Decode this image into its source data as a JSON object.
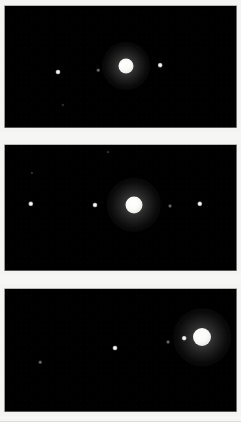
{
  "figure": {
    "background_color": "#f4f4f2",
    "plate_color": "#000000",
    "gap_color": "#f6f6f4",
    "object_color": "#ffffff"
  },
  "panels": [
    {
      "id": "panel-1",
      "label": "Exposure 1",
      "frame": {
        "x": 4,
        "y": 5,
        "width": 233,
        "height": 123
      },
      "planet": {
        "name": "jupiter-disc",
        "cx": 126,
        "cy": 66,
        "radius": 7.5,
        "brightness": "saturated"
      },
      "moons": [
        {
          "name": "moon-point",
          "cx": 58,
          "cy": 72,
          "radius": 1.4,
          "brightness": "bright"
        },
        {
          "name": "moon-point",
          "cx": 98,
          "cy": 70,
          "radius": 1.0,
          "brightness": "faint"
        },
        {
          "name": "moon-point",
          "cx": 160,
          "cy": 65,
          "radius": 1.3,
          "brightness": "bright"
        },
        {
          "name": "moon-point",
          "cx": 63,
          "cy": 105,
          "radius": 0.9,
          "brightness": "veryfaint"
        }
      ]
    },
    {
      "id": "panel-2",
      "label": "Exposure 2",
      "frame": {
        "x": 4,
        "y": 144,
        "width": 233,
        "height": 127
      },
      "planet": {
        "name": "jupiter-disc",
        "cx": 134,
        "cy": 205,
        "radius": 8.5,
        "brightness": "saturated"
      },
      "moons": [
        {
          "name": "moon-point",
          "cx": 31,
          "cy": 204,
          "radius": 1.5,
          "brightness": "bright"
        },
        {
          "name": "moon-point",
          "cx": 95,
          "cy": 205,
          "radius": 1.4,
          "brightness": "bright"
        },
        {
          "name": "moon-point",
          "cx": 170,
          "cy": 206,
          "radius": 1.1,
          "brightness": "faint"
        },
        {
          "name": "moon-point",
          "cx": 200,
          "cy": 204,
          "radius": 1.5,
          "brightness": "bright"
        },
        {
          "name": "moon-point",
          "cx": 32,
          "cy": 173,
          "radius": 0.9,
          "brightness": "veryfaint"
        },
        {
          "name": "moon-point",
          "cx": 108,
          "cy": 152,
          "radius": 0.8,
          "brightness": "veryfaint"
        }
      ]
    },
    {
      "id": "panel-3",
      "label": "Exposure 3",
      "frame": {
        "x": 4,
        "y": 288,
        "width": 233,
        "height": 124
      },
      "planet": {
        "name": "jupiter-disc",
        "cx": 202,
        "cy": 337,
        "radius": 9.0,
        "brightness": "saturated"
      },
      "moons": [
        {
          "name": "moon-point",
          "cx": 184,
          "cy": 338,
          "radius": 1.3,
          "brightness": "bright"
        },
        {
          "name": "moon-point",
          "cx": 168,
          "cy": 342,
          "radius": 1.1,
          "brightness": "faint"
        },
        {
          "name": "moon-point",
          "cx": 115,
          "cy": 348,
          "radius": 1.4,
          "brightness": "bright"
        },
        {
          "name": "moon-point",
          "cx": 40,
          "cy": 362,
          "radius": 1.0,
          "brightness": "faint"
        }
      ]
    }
  ],
  "gaps": [
    {
      "name": "panel-gap-1",
      "y": 128,
      "height": 16
    },
    {
      "name": "panel-gap-2",
      "y": 271,
      "height": 17
    },
    {
      "name": "panel-gap-bottom",
      "y": 412,
      "height": 10
    }
  ]
}
